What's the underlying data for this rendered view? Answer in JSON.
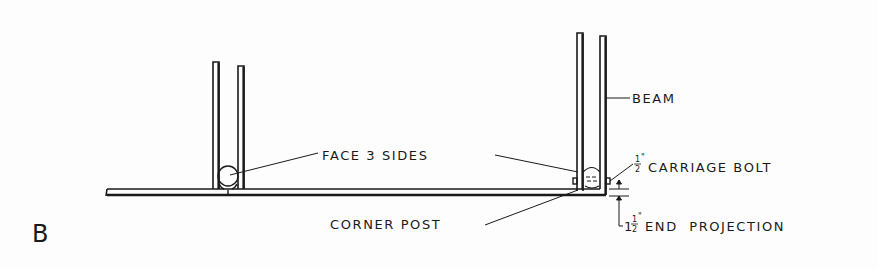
{
  "figure": {
    "panel_letter": "B",
    "labels": {
      "face_sides": "FACE 3 SIDES",
      "beam": "BEAM",
      "carriage_bolt_frac_num": "1",
      "carriage_bolt_frac_den": "2",
      "carriage_bolt_mark": "\"",
      "carriage_bolt": "CARRIAGE BOLT",
      "corner_post": "CORNER POST",
      "end_projection_whole": "1",
      "end_projection_frac_num": "1",
      "end_projection_frac_den": "2",
      "end_projection_mark": "\"",
      "end_projection": "END  PROJECTION"
    },
    "colors": {
      "ink": "#1a1a1a",
      "paper": "#fdfdfd"
    }
  }
}
